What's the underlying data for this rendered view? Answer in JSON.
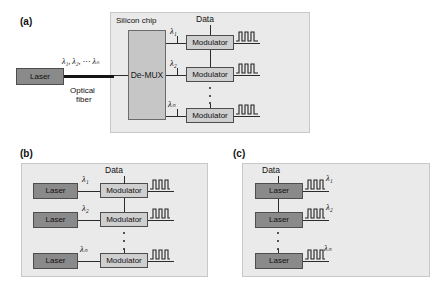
{
  "figure": {
    "panels": [
      {
        "key": "a",
        "label": "(a)",
        "chip_label": "Silicon chip",
        "data_label": "Data",
        "source_label": "Laser",
        "fiber_label_line1": "Optical",
        "fiber_label_line2": "fiber",
        "fiber_lambda": "λ₁, λ₂, ⋯ λₙ",
        "demux_label": "De-MUX",
        "rows": [
          {
            "lambda": "λ₁",
            "modulator": "Modulator"
          },
          {
            "lambda": "λ₂",
            "modulator": "Modulator"
          },
          {
            "lambda": "λₙ",
            "modulator": "Modulator"
          }
        ]
      },
      {
        "key": "b",
        "label": "(b)",
        "data_label": "Data",
        "rows": [
          {
            "laser": "Laser",
            "lambda": "λ₁",
            "modulator": "Modulator"
          },
          {
            "laser": "Laser",
            "lambda": "λ₂",
            "modulator": "Modulator"
          },
          {
            "laser": "Laser",
            "lambda": "λₙ",
            "modulator": "Modulator"
          }
        ]
      },
      {
        "key": "c",
        "label": "(c)",
        "data_label": "Data",
        "rows": [
          {
            "laser": "Laser",
            "lambda": "λ₁"
          },
          {
            "laser": "Laser",
            "lambda": "λ₂"
          },
          {
            "laser": "Laser",
            "lambda": "λₙ"
          }
        ]
      }
    ],
    "colors": {
      "panel_fill": "#eaeaea",
      "panel_border": "#c8c8c8",
      "laser_fill": "#8a8a8a",
      "modulator_fill": "#cfcfcf",
      "demux_fill": "#c6c6c6",
      "wire": "#2b2b2b",
      "background": "#ffffff"
    }
  }
}
